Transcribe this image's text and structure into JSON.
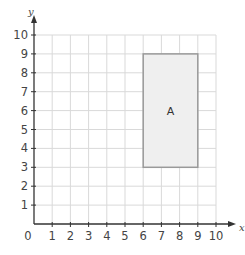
{
  "graph": {
    "x_axis": {
      "label": "x",
      "min": 0,
      "max": 10,
      "ticks": [
        "0",
        "1",
        "2",
        "3",
        "4",
        "5",
        "6",
        "7",
        "8",
        "9",
        "10"
      ]
    },
    "y_axis": {
      "label": "y",
      "min": 0,
      "max": 10,
      "ticks": [
        "1",
        "2",
        "3",
        "4",
        "5",
        "6",
        "7",
        "8",
        "9",
        "10"
      ]
    },
    "origin_label": "0",
    "grid_color": "#d9d9d9",
    "axis_color": "#333333"
  },
  "shapes": [
    {
      "label": "A",
      "type": "rectangle",
      "x1": 6,
      "y1": 3,
      "x2": 9,
      "y2": 9,
      "fill": "#efefef",
      "stroke": "#999999"
    }
  ]
}
